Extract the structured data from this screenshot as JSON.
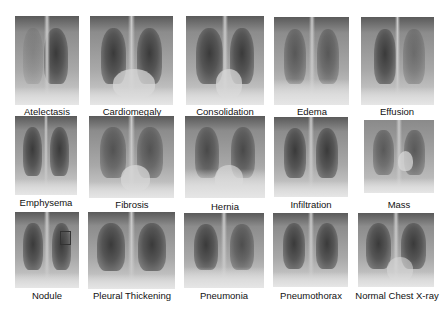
{
  "figure": {
    "rows": [
      {
        "items": [
          {
            "label": "Atelectasis"
          },
          {
            "label": "Cardiomegaly"
          },
          {
            "label": "Consolidation"
          },
          {
            "label": "Edema"
          },
          {
            "label": "Effusion"
          }
        ]
      },
      {
        "items": [
          {
            "label": "Emphysema"
          },
          {
            "label": "Fibrosis"
          },
          {
            "label": "Hernia"
          },
          {
            "label": "Infiltration"
          },
          {
            "label": "Mass"
          }
        ]
      },
      {
        "items": [
          {
            "label": "Nodule"
          },
          {
            "label": "Pleural Thickening"
          },
          {
            "label": "Pneumonia"
          },
          {
            "label": "Pneumothorax"
          },
          {
            "label": "Normal Chest X-ray"
          }
        ]
      }
    ]
  }
}
